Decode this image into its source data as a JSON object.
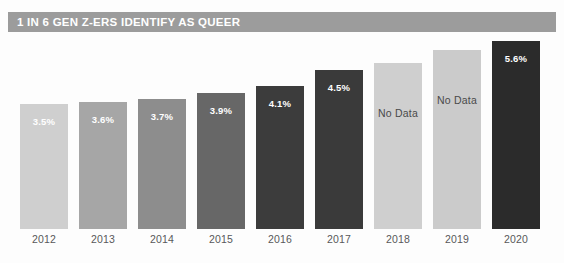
{
  "header": {
    "title": "1 IN 6 GEN Z-ERS IDENTIFY AS QUEER",
    "banner_color": "#9c9c9c",
    "title_color": "#ffffff"
  },
  "chart_data": {
    "type": "bar",
    "title": "1 IN 6 GEN Z-ERS IDENTIFY AS QUEER",
    "xlabel": "",
    "ylabel": "",
    "ylim": [
      0,
      6.3
    ],
    "grid": false,
    "legend": null,
    "categories": [
      "2012",
      "2013",
      "2014",
      "2015",
      "2016",
      "2017",
      "2018",
      "2019",
      "2020"
    ],
    "values": [
      3.5,
      3.6,
      3.7,
      3.9,
      4.1,
      4.5,
      null,
      null,
      5.6
    ],
    "bars": [
      {
        "category": "2012",
        "value": 3.5,
        "label": "3.5%",
        "has_data": true,
        "color": "#cfcfcf",
        "label_color": "#ffffff",
        "label_style": "light",
        "top_px": 70
      },
      {
        "category": "2013",
        "value": 3.6,
        "label": "3.6%",
        "has_data": true,
        "color": "#a6a6a6",
        "label_color": "#ffffff",
        "label_style": "light",
        "top_px": 68
      },
      {
        "category": "2014",
        "value": 3.7,
        "label": "3.7%",
        "has_data": true,
        "color": "#8d8d8d",
        "label_color": "#ffffff",
        "label_style": "light",
        "top_px": 65
      },
      {
        "category": "2015",
        "value": 3.9,
        "label": "3.9%",
        "has_data": true,
        "color": "#676767",
        "label_color": "#ffffff",
        "label_style": "light",
        "top_px": 59
      },
      {
        "category": "2016",
        "value": 4.1,
        "label": "4.1%",
        "has_data": true,
        "color": "#3c3c3c",
        "label_color": "#ffffff",
        "label_style": "light",
        "top_px": 52
      },
      {
        "category": "2017",
        "value": 4.5,
        "label": "4.5%",
        "has_data": true,
        "color": "#3a3a3a",
        "label_color": "#ffffff",
        "label_style": "light",
        "top_px": 36
      },
      {
        "category": "2018",
        "value": null,
        "label": "No Data",
        "has_data": false,
        "color": "#cfcfcf",
        "label_color": "#4a4a4a",
        "label_style": "dark",
        "top_px": 29
      },
      {
        "category": "2019",
        "value": null,
        "label": "No Data",
        "has_data": false,
        "color": "#cbcbcb",
        "label_color": "#4a4a4a",
        "label_style": "dark",
        "top_px": 16
      },
      {
        "category": "2020",
        "value": 5.6,
        "label": "5.6%",
        "has_data": true,
        "color": "#2b2b2b",
        "label_color": "#ffffff",
        "label_style": "light",
        "top_px": 7
      }
    ],
    "axis_labels": [
      "2012",
      "2013",
      "2014",
      "2015",
      "2016",
      "2017",
      "2018",
      "2019",
      "2020"
    ],
    "axis_label_color": "#58585a",
    "background_color": "#fdfdfd"
  },
  "layout": {
    "bar_width_px": 48,
    "bar_pitch_px": 59,
    "plot_left_px": 20,
    "baseline_y_px": 195
  }
}
